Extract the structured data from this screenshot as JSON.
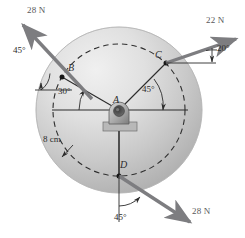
{
  "figure": {
    "type": "free-body-diagram",
    "canvas": {
      "width": 245,
      "height": 238
    },
    "colors": {
      "disk_light": "#e8e8e8",
      "disk_mid": "#c9c9c9",
      "disk_dark": "#a8a8a8",
      "arrow": "#7d7d80",
      "line": "#3a3a3a",
      "dashed": "#2f2f2f",
      "background": "#ffffff"
    }
  },
  "disk": {
    "center_label": "A",
    "center_px": {
      "x": 119,
      "y": 110
    },
    "outer_radius_px": 83,
    "dashed_radius_px": 66,
    "dashed_radius_value": "8 cm"
  },
  "dimension": {
    "label": "8 cm",
    "name": "dashed-circle-radius"
  },
  "points": [
    {
      "id": "A",
      "label": "A",
      "role": "pivot-center"
    },
    {
      "id": "B",
      "label": "B",
      "role": "force-application-point",
      "angle_from_horizontal_deg": 30,
      "quadrant": "upper-left"
    },
    {
      "id": "C",
      "label": "C",
      "role": "force-application-point",
      "angle_from_horizontal_deg": 45,
      "quadrant": "upper-right"
    },
    {
      "id": "D",
      "label": "D",
      "role": "force-application-point",
      "angle_from_horizontal_deg": 90,
      "quadrant": "bottom"
    }
  ],
  "forces": [
    {
      "id": "force-at-B",
      "magnitude": "28 N",
      "point": "B",
      "angle_label": "45°",
      "direction": "up-and-left",
      "angle_reference": "horizontal"
    },
    {
      "id": "force-at-C",
      "magnitude": "22 N",
      "point": "C",
      "angle_label": "20°",
      "direction": "up-and-right",
      "angle_reference": "horizontal"
    },
    {
      "id": "force-at-D",
      "magnitude": "28 N",
      "point": "D",
      "angle_label": "45°",
      "direction": "down-and-right",
      "angle_reference": "vertical"
    }
  ],
  "radial_angles": [
    {
      "id": "angle-AB",
      "label": "30°",
      "between": "horizontal-and-AB"
    },
    {
      "id": "angle-AC",
      "label": "45°",
      "between": "horizontal-and-AC"
    }
  ],
  "labels": {
    "force_b": "28 N",
    "force_c": "22 N",
    "force_d": "28 N",
    "angle_b_force": "45°",
    "angle_c_force": "20°",
    "angle_d_force": "45°",
    "angle_ab": "30°",
    "angle_ac": "45°",
    "point_a": "A",
    "point_b": "B",
    "point_c": "C",
    "point_d": "D",
    "dimension": "8 cm"
  }
}
